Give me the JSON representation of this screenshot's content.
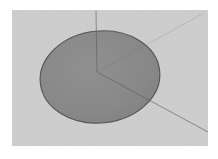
{
  "figure": {
    "title": "",
    "type": "3d-disk-axes-render",
    "canvas": {
      "width": 218,
      "height": 159,
      "background": "#ffffff"
    },
    "panel": {
      "name": "plot-panel",
      "x": 12,
      "y": 10,
      "width": 196,
      "height": 136,
      "fill": "#cdcdcd",
      "noise": true
    },
    "disk": {
      "name": "shaded-disk",
      "shape": "ellipse",
      "center_x": 100,
      "center_y": 77,
      "radius_x": 60,
      "radius_y": 46,
      "rotation_deg": -6,
      "fill": "#7d7d7d",
      "stroke": "#4a4a4a",
      "stroke_width": 1.1,
      "opacity": 0.93
    },
    "origin": {
      "name": "axes-origin",
      "x": 97,
      "y": 72
    },
    "axes": [
      {
        "name": "axis-line-vertical-up",
        "label": "z",
        "from_x": 97,
        "from_y": 72,
        "to_x": 96,
        "to_y": 11,
        "stroke": "#6e6e6e",
        "stroke_width": 0.9,
        "opacity": 0.85
      },
      {
        "name": "axis-line-down-right",
        "label": "x",
        "from_x": 97,
        "from_y": 72,
        "to_x": 208,
        "to_y": 132,
        "stroke": "#6a6a6a",
        "stroke_width": 0.9,
        "opacity": 0.85
      },
      {
        "name": "axis-line-up-right",
        "label": "y",
        "from_x": 97,
        "from_y": 72,
        "to_x": 204,
        "to_y": 13,
        "stroke": "#9a9a9a",
        "stroke_width": 0.8,
        "opacity": 0.55
      }
    ],
    "colors": {
      "background": "#ffffff",
      "panel": "#cdcdcd",
      "disk_fill": "#7d7d7d",
      "disk_edge": "#4a4a4a",
      "axis_line": "#6e6e6e",
      "axis_line_faint": "#9a9a9a"
    },
    "labels": []
  }
}
